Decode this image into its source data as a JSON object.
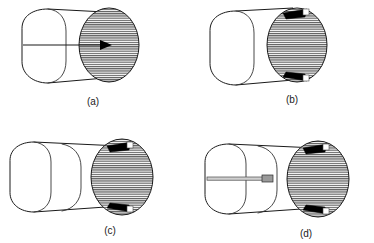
{
  "figure": {
    "background_color": "#ffffff",
    "line_color": "#1a1a1a",
    "marker_color": "#000000",
    "hatch_color": "#555555",
    "panels": [
      {
        "id": "a",
        "caption": "(a)",
        "caption_x": 93,
        "caption_y": 105,
        "body_type": "short-cylinder",
        "segments": 1,
        "endface_hatched": true,
        "markers": [
          "arrow-probe"
        ],
        "wedge_count": 0
      },
      {
        "id": "b",
        "caption": "(b)",
        "caption_x": 292,
        "caption_y": 103,
        "body_type": "short-cylinder",
        "segments": 1,
        "endface_hatched": true,
        "markers": [
          "wedge-top",
          "wedge-bottom"
        ],
        "wedge_count": 2
      },
      {
        "id": "c",
        "caption": "(c)",
        "caption_x": 110,
        "caption_y": 234,
        "body_type": "long-cylinder",
        "segments": 2,
        "endface_hatched": true,
        "markers": [
          "wedge-top",
          "wedge-bottom"
        ],
        "wedge_count": 2
      },
      {
        "id": "d",
        "caption": "(d)",
        "caption_x": 306,
        "caption_y": 237,
        "body_type": "long-cylinder",
        "segments": 2,
        "endface_hatched": true,
        "markers": [
          "probe-bar",
          "wedge-top",
          "wedge-bottom"
        ],
        "wedge_count": 2
      }
    ]
  }
}
